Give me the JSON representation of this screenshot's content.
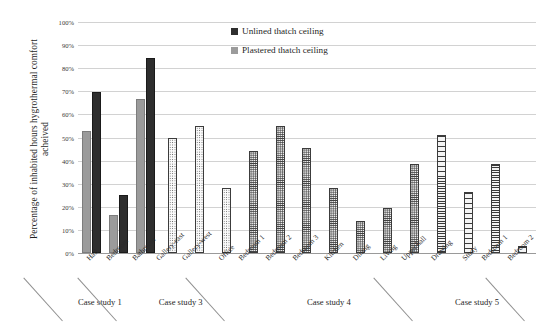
{
  "chart_data": {
    "type": "bar",
    "title": "",
    "xlabel": "",
    "ylabel": "Percentage of inhabited hours hygrothermal comfort acheived",
    "ylim": [
      0,
      100
    ],
    "ytick_labels": [
      "100%",
      "90%",
      "80%",
      "70%",
      "60%",
      "50%",
      "40%",
      "30%",
      "20%",
      "10%",
      "0%"
    ],
    "ytick_values": [
      100,
      90,
      80,
      70,
      60,
      50,
      40,
      30,
      20,
      10,
      0
    ],
    "grid": true,
    "legend_position": "top-center",
    "categories": [
      "Hall",
      "Bedroom",
      "Bathroom",
      "Gallery-east",
      "Gallery-west",
      "Office",
      "Bedroom 1",
      "Bedroom 2",
      "Bedroom 3",
      "Kitchen",
      "Dining",
      "Living",
      "Upper hall",
      "Drawing",
      "Study",
      "Bedroom 1",
      "Bedroom 2"
    ],
    "legend": [
      {
        "label": "Unlined thatch ceiling",
        "color": "#2e2e2e",
        "pattern": "solid-dark"
      },
      {
        "label": "Plastered thatch ceiling",
        "color": "#9b9b9b",
        "pattern": "solid-gray"
      }
    ],
    "series": [
      {
        "name": "Plastered thatch ceiling",
        "values": [
          53,
          16.5,
          66.5,
          null,
          null,
          null,
          null,
          null,
          null,
          null,
          null,
          null,
          null,
          null,
          null,
          null,
          null
        ]
      },
      {
        "name": "Unlined thatch ceiling",
        "values": [
          69.5,
          25,
          84.5,
          50,
          55,
          28,
          44,
          55,
          45.5,
          28,
          14,
          19.5,
          38.5,
          51,
          26.5,
          38.5,
          3
        ]
      }
    ],
    "bars": [
      {
        "category": "Hall",
        "group": "Case study 1",
        "plastered": 53,
        "unlined": 69.5,
        "pattern": "solid"
      },
      {
        "category": "Bedroom",
        "group": "Case study 1",
        "plastered": 16.5,
        "unlined": 25,
        "pattern": "solid"
      },
      {
        "category": "Bathroom",
        "group": "Case study 3",
        "plastered": 66.5,
        "unlined": 84.5,
        "pattern": "solid"
      },
      {
        "category": "Gallery-east",
        "group": "Case study 3",
        "plastered": null,
        "unlined": 50,
        "pattern": "dots"
      },
      {
        "category": "Gallery-west",
        "group": "Case study 3",
        "plastered": null,
        "unlined": 55,
        "pattern": "dots"
      },
      {
        "category": "Office",
        "group": "Case study 3",
        "plastered": null,
        "unlined": 28,
        "pattern": "dots"
      },
      {
        "category": "Bedroom 1",
        "group": "Case study 4",
        "plastered": null,
        "unlined": 44,
        "pattern": "dots-dense"
      },
      {
        "category": "Bedroom 2",
        "group": "Case study 4",
        "plastered": null,
        "unlined": 55,
        "pattern": "dots-dense"
      },
      {
        "category": "Bedroom 3",
        "group": "Case study 4",
        "plastered": null,
        "unlined": 45.5,
        "pattern": "dots-dense"
      },
      {
        "category": "Kitchen",
        "group": "Case study 4",
        "plastered": null,
        "unlined": 28,
        "pattern": "dots-dense"
      },
      {
        "category": "Dining",
        "group": "Case study 4",
        "plastered": null,
        "unlined": 14,
        "pattern": "dots-dense"
      },
      {
        "category": "Living",
        "group": "Case study 4",
        "plastered": null,
        "unlined": 19.5,
        "pattern": "dots-dense"
      },
      {
        "category": "Upper hall",
        "group": "Case study 4",
        "plastered": null,
        "unlined": 38.5,
        "pattern": "dots-dense"
      },
      {
        "category": "Drawing",
        "group": "Case study 5",
        "plastered": null,
        "unlined": 51,
        "pattern": "hlines"
      },
      {
        "category": "Study",
        "group": "Case study 5",
        "plastered": null,
        "unlined": 26.5,
        "pattern": "hlines"
      },
      {
        "category": "Bedroom 1",
        "group": "Case study 5",
        "plastered": null,
        "unlined": 38.5,
        "pattern": "hlines"
      },
      {
        "category": "Bedroom 2",
        "group": "Case study 5",
        "plastered": null,
        "unlined": 3,
        "pattern": "hlines"
      }
    ],
    "groups": [
      {
        "label": "Case study 1",
        "start": 0,
        "end": 1
      },
      {
        "label": "Case study 3",
        "start": 2,
        "end": 5
      },
      {
        "label": "Case study 4",
        "start": 6,
        "end": 12
      },
      {
        "label": "Case study 5",
        "start": 13,
        "end": 16
      }
    ]
  }
}
